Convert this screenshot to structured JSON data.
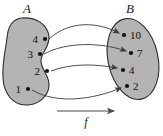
{
  "diagram": {
    "type": "function-mapping",
    "background_color": "#ffffff",
    "set_fill_color": "#b4b4b4",
    "set_stroke_color": "#2b2b2b",
    "arrow_color": "#3a3a3a",
    "dot_color": "#111111",
    "domain": {
      "name": "domain-set",
      "label": "A",
      "shape": "bean",
      "elements": [
        {
          "label": "4",
          "dot_x": 45,
          "dot_y": 39
        },
        {
          "label": "3",
          "dot_x": 40,
          "dot_y": 54
        },
        {
          "label": "2",
          "dot_x": 47,
          "dot_y": 71
        },
        {
          "label": "1",
          "dot_x": 28,
          "dot_y": 89
        }
      ]
    },
    "codomain": {
      "name": "codomain-set",
      "label": "B",
      "shape": "ellipse",
      "elements": [
        {
          "label": "10",
          "dot_x": 124,
          "dot_y": 35
        },
        {
          "label": "7",
          "dot_x": 131,
          "dot_y": 53
        },
        {
          "label": "4",
          "dot_x": 123,
          "dot_y": 70
        },
        {
          "label": "2",
          "dot_x": 127,
          "dot_y": 86
        }
      ]
    },
    "mappings": [
      {
        "from": "4",
        "to": "10"
      },
      {
        "from": "3",
        "to": "7"
      },
      {
        "from": "2",
        "to": "4"
      },
      {
        "from": "1",
        "to": "2"
      }
    ],
    "function_label": "f",
    "caption": ""
  }
}
